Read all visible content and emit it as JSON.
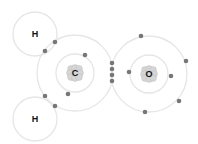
{
  "diagram": {
    "atoms": [
      {
        "id": "H1",
        "label": "H",
        "cx": 35,
        "cy": 34,
        "shells": [
          22
        ],
        "nucleus": false
      },
      {
        "id": "H2",
        "label": "H",
        "cx": 35,
        "cy": 119,
        "shells": [
          22
        ],
        "nucleus": false
      },
      {
        "id": "C",
        "label": "C",
        "cx": 75,
        "cy": 73,
        "shells": [
          19,
          38
        ],
        "nucleus": true
      },
      {
        "id": "O",
        "label": "O",
        "cx": 149,
        "cy": 74,
        "shells": [
          19,
          38
        ],
        "nucleus": true
      }
    ],
    "electrons": [
      {
        "x": 55,
        "y": 42
      },
      {
        "x": 45,
        "y": 51
      },
      {
        "x": 45,
        "y": 96
      },
      {
        "x": 55,
        "y": 106
      },
      {
        "x": 85,
        "y": 55
      },
      {
        "x": 68,
        "y": 94
      },
      {
        "x": 112,
        "y": 63
      },
      {
        "x": 112,
        "y": 69
      },
      {
        "x": 112,
        "y": 75
      },
      {
        "x": 112,
        "y": 81
      },
      {
        "x": 129,
        "y": 72
      },
      {
        "x": 171,
        "y": 76
      },
      {
        "x": 141,
        "y": 36
      },
      {
        "x": 186,
        "y": 61
      },
      {
        "x": 179,
        "y": 101
      },
      {
        "x": 145,
        "y": 112
      }
    ],
    "colors": {
      "shell": "#e6e6e6",
      "electron": "#777777",
      "text": "#111111",
      "nucleus": "#d6d6d6"
    }
  }
}
